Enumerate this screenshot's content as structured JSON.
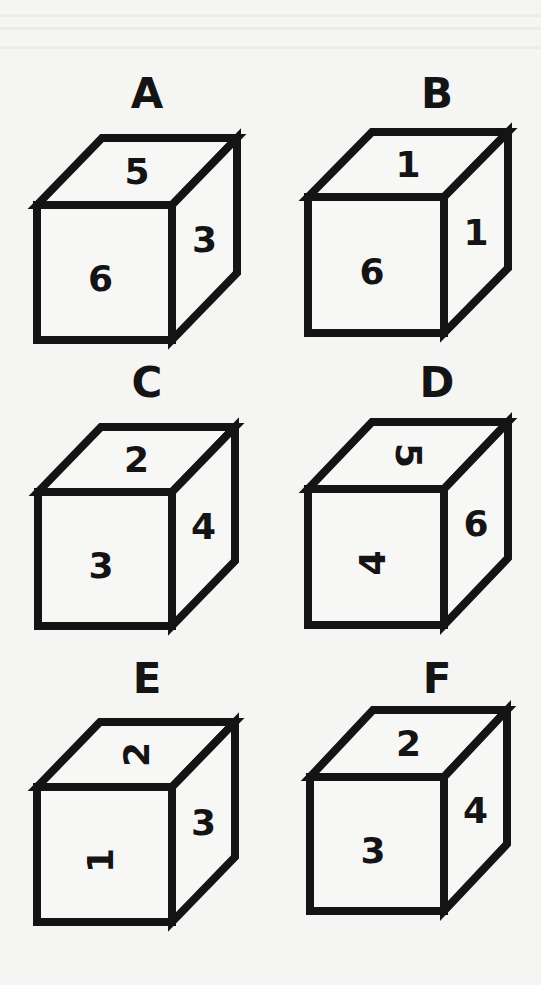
{
  "cubes": [
    {
      "label": "A",
      "top": "5",
      "front": "6",
      "right": "3",
      "top_rotation_deg": 0,
      "front_rotation_deg": 0,
      "right_rotation_deg": 0
    },
    {
      "label": "B",
      "top": "1",
      "front": "6",
      "right": "1",
      "top_rotation_deg": 0,
      "front_rotation_deg": 0,
      "right_rotation_deg": 0
    },
    {
      "label": "C",
      "top": "2",
      "front": "3",
      "right": "4",
      "top_rotation_deg": 0,
      "front_rotation_deg": 0,
      "right_rotation_deg": 0
    },
    {
      "label": "D",
      "top": "5",
      "front": "4",
      "right": "6",
      "top_rotation_deg": 90,
      "front_rotation_deg": -90,
      "right_rotation_deg": 0
    },
    {
      "label": "E",
      "top": "2",
      "front": "1",
      "right": "3",
      "top_rotation_deg": -90,
      "front_rotation_deg": -90,
      "right_rotation_deg": 0
    },
    {
      "label": "F",
      "top": "2",
      "front": "3",
      "right": "4",
      "top_rotation_deg": 0,
      "front_rotation_deg": 0,
      "right_rotation_deg": 0
    }
  ]
}
